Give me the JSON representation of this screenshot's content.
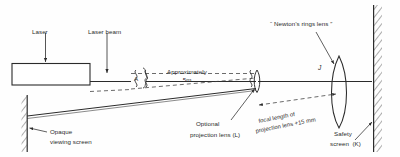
{
  "diagram": {
    "stroke_color": "#2b2b2b",
    "hatch_color": "#555555",
    "dash_color": "#3a3a3a",
    "labels": {
      "laser": "Laser",
      "laser_beam": "Laser beam",
      "newtons_rings_lens": "“ Newton’s rings lens ”",
      "approximately": "Approximately",
      "approximately_distance": "5m",
      "bracket_a": "A",
      "lens_marker_j": "J",
      "opaque_line1": "Opaque",
      "opaque_line2": "viewing screen",
      "optional_line1": "Optional",
      "optional_line2": "projection lens (L)",
      "focal_line1": "focal length of",
      "focal_line2": "projection lens +15 mm",
      "safety_line1": "Safety",
      "safety_line2": "screen  (K)"
    },
    "components": [
      {
        "name": "laser-body",
        "kind": "rectangle"
      },
      {
        "name": "opaque-viewing-screen",
        "kind": "hatched-vertical-screen"
      },
      {
        "name": "optional-projection-lens",
        "kind": "thin-lens"
      },
      {
        "name": "newtons-rings-lens",
        "kind": "thin-lens"
      },
      {
        "name": "safety-screen",
        "kind": "hatched-vertical-screen"
      }
    ],
    "measurements": [
      {
        "name": "beam-path-length",
        "label": "Approximately 5m",
        "segment": "A"
      },
      {
        "name": "projection-lens-focal-length",
        "label": "+15 mm"
      }
    ]
  }
}
